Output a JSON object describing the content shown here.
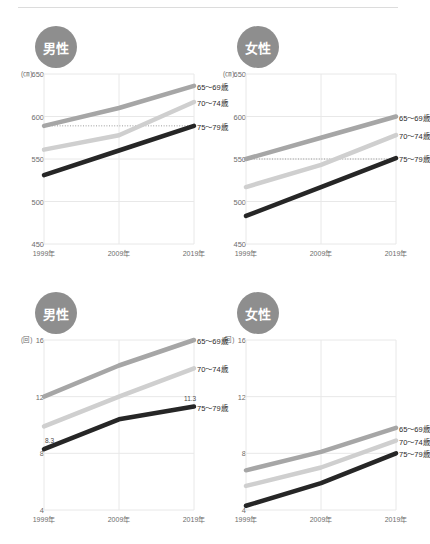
{
  "page": {
    "divider": "top-rule"
  },
  "panels": [
    {
      "id": "male-height",
      "badge": "男性",
      "unit": "(㎝)",
      "ytitle": "",
      "chart_data": {
        "type": "line",
        "title": "男性 身長",
        "xlabel": "",
        "ylabel": "(㎝)",
        "categories": [
          "1999年",
          "2009年",
          "2019年"
        ],
        "yticks": [
          450,
          500,
          550,
          600,
          650
        ],
        "ylim": [
          450,
          650
        ],
        "grid": true,
        "legend_position": "right-inline",
        "reference_line": 589,
        "series": [
          {
            "name": "65〜69歳",
            "values": [
              589,
              610,
              636
            ],
            "color": "#a6a6a6"
          },
          {
            "name": "70〜74歳",
            "values": [
              561,
              578,
              617
            ],
            "color": "#cfcfcf"
          },
          {
            "name": "75〜79歳",
            "values": [
              531,
              560,
              589
            ],
            "color": "#262626"
          }
        ],
        "annotations": []
      }
    },
    {
      "id": "female-height",
      "badge": "女性",
      "unit": "(㎝)",
      "chart_data": {
        "type": "line",
        "title": "女性 身長",
        "xlabel": "",
        "ylabel": "(㎝)",
        "categories": [
          "1999年",
          "2009年",
          "2019年"
        ],
        "yticks": [
          450,
          500,
          550,
          600,
          650
        ],
        "ylim": [
          450,
          650
        ],
        "grid": true,
        "legend_position": "right-inline",
        "reference_line": 550,
        "series": [
          {
            "name": "65〜69歳",
            "values": [
              550,
              575,
              600
            ],
            "color": "#a6a6a6"
          },
          {
            "name": "70〜74歳",
            "values": [
              517,
              543,
              578
            ],
            "color": "#cfcfcf"
          },
          {
            "name": "75〜79歳",
            "values": [
              483,
              517,
              551
            ],
            "color": "#262626"
          }
        ],
        "annotations": []
      }
    },
    {
      "id": "male-count",
      "badge": "男性",
      "unit": "(回)",
      "chart_data": {
        "type": "line",
        "title": "男性 回数",
        "xlabel": "",
        "ylabel": "(回)",
        "categories": [
          "1999年",
          "2009年",
          "2019年"
        ],
        "yticks": [
          4,
          8,
          12,
          16
        ],
        "ylim": [
          4,
          16
        ],
        "grid": true,
        "legend_position": "right-inline",
        "reference_line": null,
        "series": [
          {
            "name": "65〜69歳",
            "values": [
              12.0,
              14.2,
              16.0
            ],
            "color": "#a6a6a6"
          },
          {
            "name": "70〜74歳",
            "values": [
              9.9,
              12.0,
              14.0
            ],
            "color": "#cfcfcf"
          },
          {
            "name": "75〜79歳",
            "values": [
              8.3,
              10.4,
              11.3
            ],
            "color": "#262626"
          }
        ],
        "annotations": [
          {
            "text": "8.3",
            "series": "75〜79歳",
            "x": "1999年",
            "value": 8.3
          },
          {
            "text": "11.3",
            "series": "75〜79歳",
            "x": "2019年",
            "value": 11.3
          }
        ]
      }
    },
    {
      "id": "female-count",
      "badge": "女性",
      "unit": "(回)",
      "chart_data": {
        "type": "line",
        "title": "女性 回数",
        "xlabel": "",
        "ylabel": "(回)",
        "categories": [
          "1999年",
          "2009年",
          "2019年"
        ],
        "yticks": [
          4,
          8,
          12,
          16
        ],
        "ylim": [
          4,
          16
        ],
        "grid": true,
        "legend_position": "right-inline",
        "reference_line": null,
        "series": [
          {
            "name": "65〜69歳",
            "values": [
              6.8,
              8.1,
              9.8
            ],
            "color": "#a6a6a6"
          },
          {
            "name": "70〜74歳",
            "values": [
              5.7,
              7.0,
              8.9
            ],
            "color": "#cfcfcf"
          },
          {
            "name": "75〜79歳",
            "values": [
              4.3,
              5.9,
              8.0
            ],
            "color": "#262626"
          }
        ],
        "annotations": []
      }
    }
  ],
  "colors": {
    "background": "#ffffff",
    "badge": "#8e8e8e",
    "grid": "#e8e8e8",
    "axis_text": "#6d6d6d",
    "series_65_69": "#a6a6a6",
    "series_70_74": "#cfcfcf",
    "series_75_79": "#262626"
  }
}
